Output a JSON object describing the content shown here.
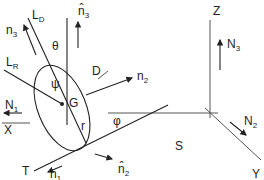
{
  "figure": {
    "labels": {
      "LD": {
        "main": "L",
        "sub": "D"
      },
      "n3hat": {
        "main": "n̂",
        "sub": "3"
      },
      "n3": {
        "main": "n",
        "sub": "3"
      },
      "theta": "θ",
      "LR": {
        "main": "L",
        "sub": "R"
      },
      "psi": "ψ",
      "D": "D",
      "n2": {
        "main": "n",
        "sub": "2"
      },
      "N1": {
        "main": "N",
        "sub": "1"
      },
      "X": "X",
      "G": "G",
      "r": "r",
      "phi": "φ",
      "S": "S",
      "T": "T",
      "n1": {
        "main": "n",
        "sub": "1"
      },
      "n2hat": {
        "main": "n̂",
        "sub": "2"
      },
      "Z": "Z",
      "N3": {
        "main": "N",
        "sub": "3"
      },
      "N2": {
        "main": "N",
        "sub": "2"
      },
      "Y": "Y"
    }
  }
}
